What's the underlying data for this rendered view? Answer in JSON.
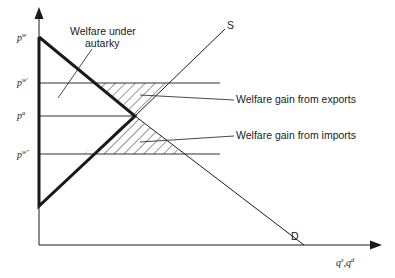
{
  "diagram": {
    "y_axis_labels": {
      "pw": {
        "base": "p",
        "sup": "w"
      },
      "pw_prime": {
        "base": "p",
        "sup": "w'"
      },
      "pa": {
        "base": "p",
        "sup": "a"
      },
      "pw_double_prime": {
        "base": "p",
        "sup": "w\""
      }
    },
    "x_axis_label": {
      "base1": "q",
      "sup1": "s",
      "sep": ",",
      "base2": "q",
      "sup2": "d"
    },
    "curve_labels": {
      "supply": "S",
      "demand": "D"
    },
    "annotations": {
      "autarky_line1": "Welfare under",
      "autarky_line2": "autarky",
      "exports": "Welfare gain from exports",
      "imports": "Welfare gain from imports"
    },
    "colors": {
      "ink": "#1a1a1a",
      "background": "#ffffff"
    }
  }
}
